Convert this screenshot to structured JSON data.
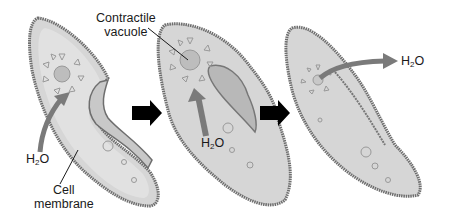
{
  "labels": {
    "contractile_vacuole": [
      "Contractile",
      "vacuole"
    ],
    "cell_membrane": [
      "Cell",
      "membrane"
    ],
    "water_1": {
      "main": "H",
      "sub": "2",
      "tail": "O"
    },
    "water_2": {
      "main": "H",
      "sub": "2",
      "tail": "O"
    },
    "water_3": {
      "main": "H",
      "sub": "2",
      "tail": "O"
    }
  },
  "stages": [
    {
      "id": 1,
      "description": "Water enters cell and moves toward contractile vacuole"
    },
    {
      "id": 2,
      "description": "Contractile vacuole fills with water"
    },
    {
      "id": 3,
      "description": "Contractile vacuole contracts and expels water out of cell"
    }
  ],
  "colors": {
    "cell_fill": "#d6d6d6",
    "cell_inner": "#e6e6e6",
    "membrane": "#6e6e6e",
    "arrow_gray": "#7a7a7a",
    "step_arrow": "#000000",
    "text": "#1a1a1a"
  }
}
